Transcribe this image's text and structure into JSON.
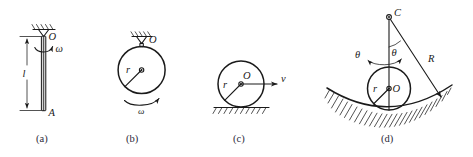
{
  "figure": {
    "background_color": "#ffffff",
    "ink_color": "#1a1a1a",
    "caption_color": "#2a2a3a"
  },
  "panels": [
    {
      "id": "a",
      "caption": "(a)",
      "description": "Slender rod hanging from a fixed pivot, rotating about its vertical axis",
      "labels": {
        "pivot": "O",
        "end": "A",
        "length": "l",
        "angular_velocity": "ω"
      },
      "icons": {
        "support": "hatched-ceiling-support-icon",
        "spin": "omega-spin-arrow-icon",
        "dimension": "length-dimension-arrow-icon"
      }
    },
    {
      "id": "b",
      "caption": "(b)",
      "description": "Disc suspended from a pivot at its rim, rotating in plane",
      "labels": {
        "pivot": "O",
        "radius": "r",
        "angular_velocity": "ω"
      },
      "icons": {
        "support": "hatched-ceiling-support-icon",
        "spin": "omega-arc-arrow-icon",
        "center": "center-dot-icon"
      }
    },
    {
      "id": "c",
      "caption": "(c)",
      "description": "Disc rolling without slipping on a flat horizontal surface",
      "labels": {
        "center": "O",
        "radius": "r",
        "velocity": "v"
      },
      "icons": {
        "ground": "hatched-ground-icon",
        "velocity": "velocity-vector-arrow-icon",
        "center": "center-dot-icon"
      }
    },
    {
      "id": "d",
      "caption": "(d)",
      "description": "Disc rolling inside a concave circular surface of radius R",
      "labels": {
        "curvature_center": "C",
        "disc_center": "O",
        "radius_disc": "r",
        "radius_surface": "R",
        "angle_upper": "θ",
        "angle_lower": "θ"
      },
      "icons": {
        "surface": "hatched-concave-surface-icon",
        "swing": "theta-swing-double-arrow-icon",
        "angle_arc": "theta-angle-arc-icon",
        "center_c": "center-dot-icon",
        "center_o": "center-dot-icon"
      }
    }
  ]
}
